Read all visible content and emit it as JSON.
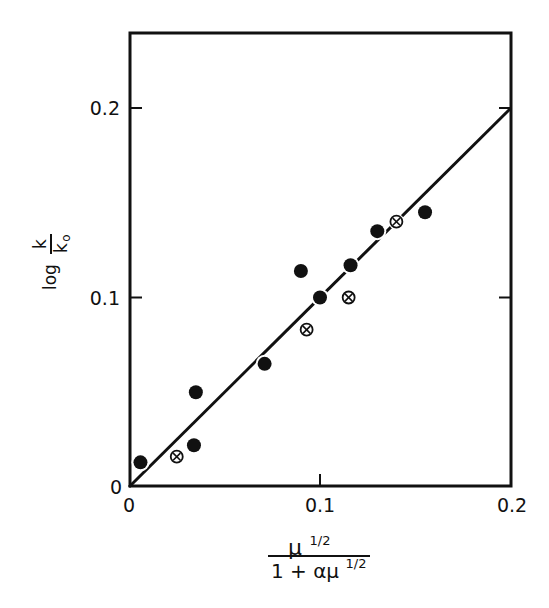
{
  "chart_data": {
    "type": "scatter",
    "title": "",
    "xlabel": "μ^(1/2) / (1 + αμ^(1/2))",
    "ylabel": "log k/k₀",
    "xlim": [
      0,
      0.2
    ],
    "ylim": [
      0,
      0.24
    ],
    "x_ticks": [
      0,
      0.1,
      0.2
    ],
    "x_tick_labels": [
      "0",
      "0.1",
      "0.2"
    ],
    "y_ticks": [
      0,
      0.1,
      0.2
    ],
    "y_tick_labels": [
      "0",
      "0.1",
      "0.2"
    ],
    "grid": false,
    "legend": "none",
    "series": [
      {
        "name": "filled circles",
        "marker": "filled-circle",
        "points": [
          {
            "x": 0.006,
            "y": 0.013
          },
          {
            "x": 0.034,
            "y": 0.022
          },
          {
            "x": 0.035,
            "y": 0.05
          },
          {
            "x": 0.071,
            "y": 0.065
          },
          {
            "x": 0.09,
            "y": 0.114
          },
          {
            "x": 0.1,
            "y": 0.1
          },
          {
            "x": 0.116,
            "y": 0.117
          },
          {
            "x": 0.13,
            "y": 0.135
          },
          {
            "x": 0.155,
            "y": 0.145
          }
        ]
      },
      {
        "name": "crossed circles",
        "marker": "circle-x",
        "points": [
          {
            "x": 0.025,
            "y": 0.016
          },
          {
            "x": 0.093,
            "y": 0.083
          },
          {
            "x": 0.115,
            "y": 0.1
          },
          {
            "x": 0.14,
            "y": 0.14
          }
        ]
      }
    ],
    "fit_line": {
      "x": [
        0,
        0.2
      ],
      "y": [
        0,
        0.2
      ],
      "slope": 1.0
    }
  },
  "labels": {
    "x_tick_0": "0",
    "x_tick_1": "0.1",
    "x_tick_2": "0.2",
    "y_tick_0": "0",
    "y_tick_1": "0.1",
    "y_tick_2": "0.2",
    "ylabel_log": "log",
    "ylabel_num": "k",
    "ylabel_den": "k",
    "ylabel_den_sub": "o",
    "xlabel_num": "μ",
    "xlabel_num_sup": "1/2",
    "xlabel_den": "1 + αμ",
    "xlabel_den_sup": "1/2"
  },
  "colors": {
    "ink": "#111111",
    "background": "#ffffff"
  }
}
